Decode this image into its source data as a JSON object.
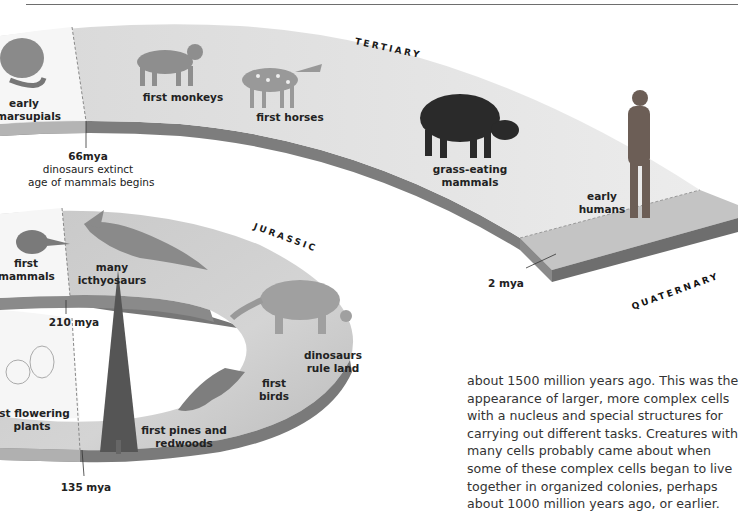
{
  "eras": {
    "tertiary": "TERTIARY",
    "jurassic": "JURASSIC",
    "quaternary": "QUATERNARY"
  },
  "labels": {
    "early_marsupials": [
      "early",
      "marsupials"
    ],
    "first_monkeys": "first monkeys",
    "first_horses": "first horses",
    "grass_eating_mammals": [
      "grass-eating",
      "mammals"
    ],
    "early_humans": [
      "early",
      "humans"
    ],
    "first_mammals": [
      "first",
      "mammals"
    ],
    "many_icthyosaurs": [
      "many",
      "icthyosaurs"
    ],
    "dinosaurs_rule_land": [
      "dinosaurs",
      "rule land"
    ],
    "first_birds": [
      "first",
      "birds"
    ],
    "first_flowering_plants": [
      "rst flowering",
      "plants"
    ],
    "first_pines_redwoods": [
      "first pines and",
      "redwoods"
    ]
  },
  "markers": {
    "m66": {
      "time": "66mya",
      "line1": "dinosaurs extinct",
      "line2": "age of mammals begins"
    },
    "m210": {
      "time": "210 mya"
    },
    "m135": {
      "time": "135 mya"
    },
    "m2": {
      "time": "2 mya"
    }
  },
  "body_text": "about 1500 million years ago. This was the appearance of larger, more complex cells with a nucleus and special structures for carrying out different tasks. Creatures with many cells probably came about when some of these complex cells began to live together in organized colonies, perhaps about 1000 million years ago, or earlier.",
  "colors": {
    "band_top": "#e2e2e2",
    "band_top_light": "#f4f4f4",
    "band_edge": "#7a7a7a",
    "band_edge_light": "#b0b0b0",
    "quaternary_top": "#c2c2c2",
    "text": "#222222"
  }
}
